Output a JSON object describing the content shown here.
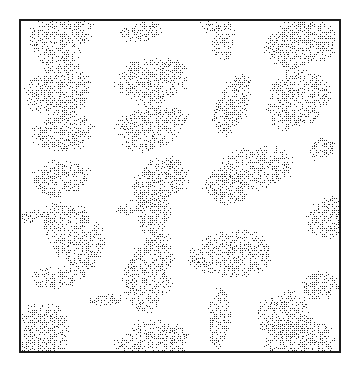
{
  "figure": {
    "type": "stippled-micrograph",
    "canvas": {
      "width": 361,
      "height": 371
    },
    "background_color": "#ffffff",
    "frame": {
      "x": 19,
      "y": 19,
      "width": 322,
      "height": 334,
      "border_color": "#1a1a1a",
      "border_width": 2,
      "fill_color": "#ffffff"
    },
    "stipple": {
      "dot_color": "#2b2b2b",
      "dot_size": 1,
      "cell": 2,
      "fill_probability": 0.52,
      "edge_roughness": 1.6,
      "apparent_gray": "#8a8a8a"
    },
    "particle_count": 31,
    "particles": [
      {
        "id": 1,
        "cx": 60,
        "cy": 36,
        "rx": 34,
        "ry": 26,
        "rot": -32,
        "shape": "ellipse"
      },
      {
        "id": 2,
        "cx": 141,
        "cy": 32,
        "rx": 21,
        "ry": 10,
        "rot": -10,
        "shape": "ellipse"
      },
      {
        "id": 3,
        "cx": 223,
        "cy": 40,
        "rx": 11,
        "ry": 22,
        "rot": 6,
        "shape": "ellipse"
      },
      {
        "id": 4,
        "cx": 300,
        "cy": 43,
        "rx": 37,
        "ry": 24,
        "rot": -12,
        "shape": "ellipse"
      },
      {
        "id": 5,
        "cx": 152,
        "cy": 80,
        "rx": 36,
        "ry": 23,
        "rot": -8,
        "shape": "ellipse"
      },
      {
        "id": 6,
        "cx": 59,
        "cy": 90,
        "rx": 34,
        "ry": 27,
        "rot": -22,
        "shape": "ellipse"
      },
      {
        "id": 7,
        "cx": 297,
        "cy": 98,
        "rx": 34,
        "ry": 28,
        "rot": -38,
        "shape": "ellipse"
      },
      {
        "id": 8,
        "cx": 232,
        "cy": 105,
        "rx": 16,
        "ry": 32,
        "rot": 22,
        "shape": "ellipse"
      },
      {
        "id": 9,
        "cx": 150,
        "cy": 128,
        "rx": 36,
        "ry": 22,
        "rot": -16,
        "shape": "ellipse"
      },
      {
        "id": 10,
        "cx": 63,
        "cy": 132,
        "rx": 32,
        "ry": 19,
        "rot": -8,
        "shape": "ellipse"
      },
      {
        "id": 11,
        "cx": 160,
        "cy": 180,
        "rx": 31,
        "ry": 21,
        "rot": -30,
        "shape": "ellipse"
      },
      {
        "id": 12,
        "cx": 59,
        "cy": 178,
        "rx": 30,
        "ry": 17,
        "rot": -6,
        "shape": "ellipse"
      },
      {
        "id": 13,
        "cx": 255,
        "cy": 168,
        "rx": 39,
        "ry": 21,
        "rot": -6,
        "shape": "ellipse"
      },
      {
        "id": 14,
        "cx": 226,
        "cy": 186,
        "rx": 22,
        "ry": 18,
        "rot": 18,
        "shape": "ellipse"
      },
      {
        "id": 15,
        "cx": 321,
        "cy": 148,
        "rx": 13,
        "ry": 11,
        "rot": -20,
        "shape": "ellipse"
      },
      {
        "id": 16,
        "cx": 333,
        "cy": 216,
        "rx": 30,
        "ry": 20,
        "rot": -24,
        "shape": "ellipse"
      },
      {
        "id": 17,
        "cx": 154,
        "cy": 214,
        "rx": 16,
        "ry": 22,
        "rot": 14,
        "shape": "ellipse"
      },
      {
        "id": 18,
        "cx": 131,
        "cy": 206,
        "rx": 16,
        "ry": 7,
        "rot": -18,
        "shape": "ellipse"
      },
      {
        "id": 19,
        "cx": 75,
        "cy": 235,
        "rx": 26,
        "ry": 38,
        "rot": -38,
        "shape": "ellipse"
      },
      {
        "id": 20,
        "cx": 31,
        "cy": 216,
        "rx": 14,
        "ry": 6,
        "rot": -14,
        "shape": "ellipse"
      },
      {
        "id": 21,
        "cx": 232,
        "cy": 254,
        "rx": 41,
        "ry": 24,
        "rot": -4,
        "shape": "ellipse"
      },
      {
        "id": 22,
        "cx": 148,
        "cy": 273,
        "rx": 23,
        "ry": 41,
        "rot": 16,
        "shape": "ellipse"
      },
      {
        "id": 23,
        "cx": 55,
        "cy": 277,
        "rx": 26,
        "ry": 12,
        "rot": -6,
        "shape": "ellipse"
      },
      {
        "id": 24,
        "cx": 106,
        "cy": 299,
        "rx": 20,
        "ry": 6,
        "rot": -4,
        "shape": "ellipse"
      },
      {
        "id": 25,
        "cx": 41,
        "cy": 330,
        "rx": 30,
        "ry": 26,
        "rot": -18,
        "shape": "ellipse"
      },
      {
        "id": 26,
        "cx": 152,
        "cy": 341,
        "rx": 37,
        "ry": 21,
        "rot": -8,
        "shape": "ellipse"
      },
      {
        "id": 27,
        "cx": 219,
        "cy": 318,
        "rx": 11,
        "ry": 31,
        "rot": 2,
        "shape": "ellipse"
      },
      {
        "id": 28,
        "cx": 283,
        "cy": 315,
        "rx": 26,
        "ry": 24,
        "rot": -16,
        "shape": "ellipse"
      },
      {
        "id": 29,
        "cx": 299,
        "cy": 341,
        "rx": 36,
        "ry": 24,
        "rot": -6,
        "shape": "ellipse"
      },
      {
        "id": 30,
        "cx": 320,
        "cy": 285,
        "rx": 20,
        "ry": 14,
        "rot": -10,
        "shape": "ellipse"
      },
      {
        "id": 31,
        "cx": 209,
        "cy": 24,
        "rx": 9,
        "ry": 9,
        "rot": 0,
        "shape": "ellipse"
      }
    ]
  }
}
